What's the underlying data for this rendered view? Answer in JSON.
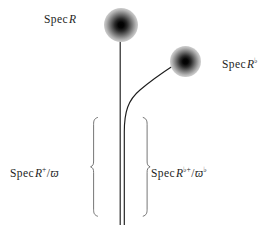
{
  "figure": {
    "background_color": "#ffffff",
    "ink_color": "#1d1d1d",
    "width": 277,
    "height": 225
  },
  "labels": {
    "spec_top": {
      "full_text": "Spec R",
      "spec": "Spec",
      "ring": "R"
    },
    "spec_flat": {
      "full_text": "Spec R♭",
      "spec": "Spec",
      "ring": "R",
      "sup": "♭"
    },
    "spec_plus_quotient": {
      "full_text": "Spec R⁺/ϖ",
      "spec": "Spec",
      "ring": "R",
      "sup": "+",
      "slash": "/",
      "uniformizer": "ϖ"
    },
    "spec_flat_plus_quotient": {
      "full_text": "Spec R♭⁺/ϖ♭",
      "spec": "Spec",
      "ring": "R",
      "sup": "♭+",
      "slash": "/",
      "uniformizer": "ϖ",
      "uniformizer_sup": "♭"
    }
  },
  "points": {
    "top_point": {
      "name": "closed-point-top",
      "cx": 121,
      "cy": 25,
      "radius": 17
    },
    "right_point": {
      "name": "closed-point-flat",
      "cx": 185.5,
      "cy": 61.5,
      "radius": 15.5
    }
  },
  "curves": {
    "vertical_stem": {
      "name": "vertical-stem",
      "x": 120,
      "y_top": 25,
      "y_bottom": 225
    },
    "second_stem": {
      "name": "second-stem",
      "x": 124,
      "y_top": 118,
      "y_bottom": 225
    },
    "branch": {
      "name": "branch-curve",
      "from_x": 124,
      "from_y": 225,
      "to_x": 172,
      "to_y": 61
    }
  },
  "braces": {
    "left": {
      "name": "left-brace",
      "x": 93,
      "y_top": 117,
      "y_bottom": 217,
      "direction": "left"
    },
    "right": {
      "name": "right-brace",
      "x": 147,
      "y_top": 117,
      "y_bottom": 217,
      "direction": "right"
    }
  }
}
